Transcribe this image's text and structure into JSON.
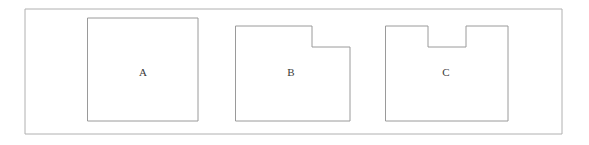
{
  "figure": {
    "background_color": "#ffffff",
    "width": 589,
    "height": 145,
    "frame": {
      "name": "outer-frame",
      "stroke_color": "#b0b0b0",
      "fill_color": "#ffffff",
      "x": 25,
      "y": 9,
      "width": 537,
      "height": 125,
      "points": "25,9 562,9 562,134 25,134"
    },
    "shape_stroke_color": "#9a9a9a",
    "shape_fill_color": "#ffffff",
    "label_color": "#3a3a3a",
    "shapes": [
      {
        "id": "shape-a",
        "label": "A",
        "type": "rectangle",
        "description": "Plain rectangle with no notch",
        "points": "88,18 198,18 198,121 88,121",
        "label_x": 143,
        "label_y": 73
      },
      {
        "id": "shape-b",
        "label": "B",
        "type": "rectangle-with-corner-notch",
        "description": "Rectangle with a notch removed from the top-right corner",
        "points": "236,26 312,26 312,47 350,47 350,121 236,121",
        "label_x": 291,
        "label_y": 73
      },
      {
        "id": "shape-c",
        "label": "C",
        "type": "rectangle-with-top-notch",
        "description": "Rectangle with a rectangular notch removed from the middle of the top edge",
        "points": "386,26 428,26 428,47 466,47 466,26 508,26 508,121 386,121",
        "label_x": 446,
        "label_y": 73
      }
    ]
  }
}
